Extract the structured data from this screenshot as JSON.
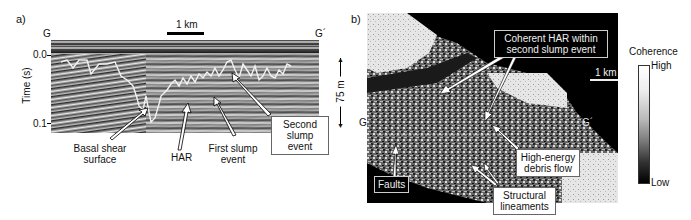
{
  "figure": {
    "panel_a": {
      "label": "a)",
      "scale_bar": "1 km",
      "endpoint_left": "G",
      "endpoint_right": "G´",
      "y_axis_label": "Time (s)",
      "y_ticks": [
        "0.0",
        "0.1"
      ],
      "vertical_scale": "75 m",
      "annotations": {
        "basal_shear": "Basal shear surface",
        "basal_shear_line1": "Basal shear",
        "basal_shear_line2": "surface",
        "har": "HAR",
        "first_slump_line1": "First slump",
        "first_slump_line2": "event",
        "second_slump_line1": "Second",
        "second_slump_line2": "slump event"
      }
    },
    "panel_b": {
      "label": "b)",
      "scale_bar": "1 km",
      "endpoint_left": "G",
      "endpoint_right": "G´",
      "annotations": {
        "coherent_har_line1": "Coherent HAR within",
        "coherent_har_line2": "second slump event",
        "debris_line1": "High-energy",
        "debris_line2": "debris flow",
        "faults": "Faults",
        "lineaments_line1": "Structural",
        "lineaments_line2": "lineaments"
      },
      "colorbar": {
        "title": "Coherence",
        "high": "High",
        "low": "Low"
      }
    }
  }
}
